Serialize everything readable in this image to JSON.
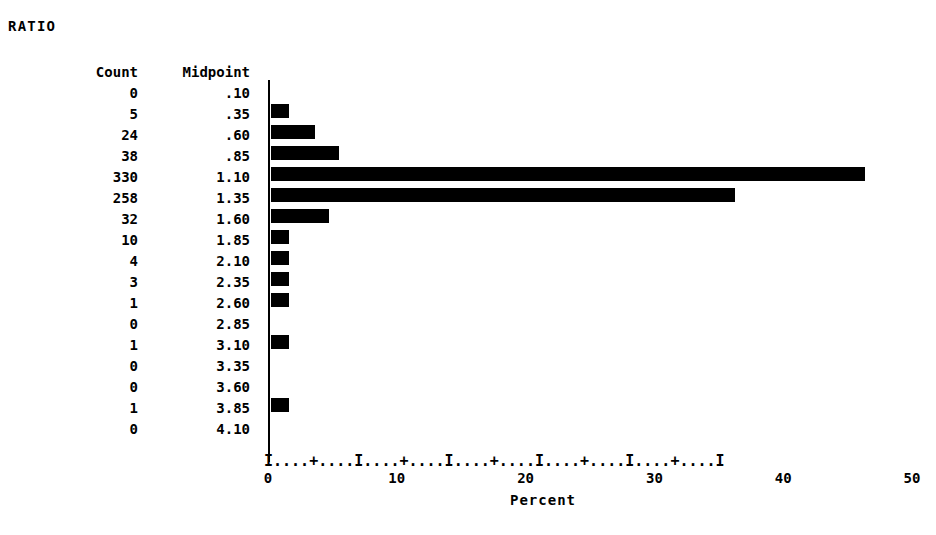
{
  "title": "RATIO",
  "table": {
    "headers": {
      "count": "Count",
      "midpoint": "Midpoint"
    },
    "rows": [
      {
        "count": "0",
        "midpoint": ".10",
        "percent": 0.0
      },
      {
        "count": "5",
        "midpoint": ".35",
        "percent": 0.7
      },
      {
        "count": "24",
        "midpoint": ".60",
        "percent": 3.4
      },
      {
        "count": "38",
        "midpoint": ".85",
        "percent": 5.3
      },
      {
        "count": "330",
        "midpoint": "1.10",
        "percent": 46.1
      },
      {
        "count": "258",
        "midpoint": "1.35",
        "percent": 36.0
      },
      {
        "count": "32",
        "midpoint": "1.60",
        "percent": 4.5
      },
      {
        "count": "10",
        "midpoint": "1.85",
        "percent": 1.4
      },
      {
        "count": "4",
        "midpoint": "2.10",
        "percent": 0.6
      },
      {
        "count": "3",
        "midpoint": "2.35",
        "percent": 0.4
      },
      {
        "count": "1",
        "midpoint": "2.60",
        "percent": 0.1
      },
      {
        "count": "0",
        "midpoint": "2.85",
        "percent": 0.0
      },
      {
        "count": "1",
        "midpoint": "3.10",
        "percent": 0.1
      },
      {
        "count": "0",
        "midpoint": "3.35",
        "percent": 0.0
      },
      {
        "count": "0",
        "midpoint": "3.60",
        "percent": 0.0
      },
      {
        "count": "1",
        "midpoint": "3.85",
        "percent": 0.1
      },
      {
        "count": "0",
        "midpoint": "4.10",
        "percent": 0.0
      }
    ]
  },
  "axis": {
    "ascii": "I....+....I....+....I....+....I....+....I....+....I",
    "ticks": [
      "0",
      "10",
      "20",
      "30",
      "40",
      "50"
    ],
    "xlabel": "Percent"
  },
  "chart_data": {
    "type": "bar",
    "orientation": "horizontal",
    "title": "RATIO",
    "xlabel": "Percent",
    "ylabel": "Midpoint",
    "xlim": [
      0,
      50
    ],
    "grid": false,
    "legend": null,
    "categories": [
      ".10",
      ".35",
      ".60",
      ".85",
      "1.10",
      "1.35",
      "1.60",
      "1.85",
      "2.10",
      "2.35",
      "2.60",
      "2.85",
      "3.10",
      "3.35",
      "3.60",
      "3.85",
      "4.10"
    ],
    "counts": [
      0,
      5,
      24,
      38,
      330,
      258,
      32,
      10,
      4,
      3,
      1,
      0,
      1,
      0,
      0,
      1,
      0
    ],
    "values": [
      0.0,
      0.7,
      3.4,
      5.3,
      46.1,
      36.0,
      4.5,
      1.4,
      0.6,
      0.4,
      0.1,
      0.0,
      0.1,
      0.0,
      0.0,
      0.1,
      0.0
    ],
    "tick_labels": [
      "0",
      "10",
      "20",
      "30",
      "40",
      "50"
    ],
    "bar_color": "#000000",
    "background": "#ffffff"
  },
  "colors": {
    "foreground": "#000000",
    "background": "#ffffff"
  }
}
